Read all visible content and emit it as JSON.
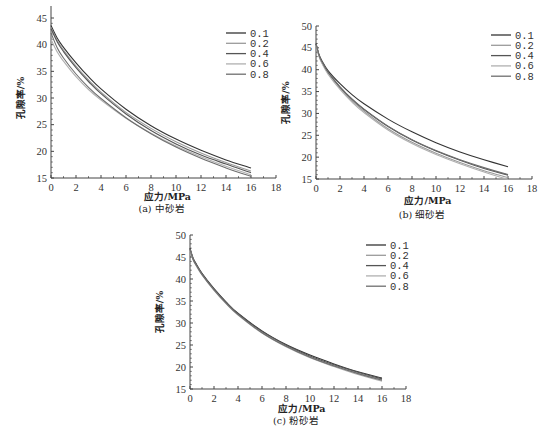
{
  "chart_data": [
    {
      "id": "a",
      "type": "line",
      "title": "(a) 中砂岩",
      "xlabel": "应力/MPa",
      "ylabel": "孔隙率/%",
      "xlim": [
        0,
        18
      ],
      "ylim": [
        15,
        47
      ],
      "xticks": [
        0,
        2,
        4,
        6,
        8,
        10,
        12,
        14,
        16,
        18
      ],
      "yticks": [
        15,
        20,
        25,
        30,
        35,
        40,
        45
      ],
      "grid": false,
      "legend_position": "upper right",
      "x": [
        0,
        0.5,
        1,
        2,
        3,
        4,
        6,
        8,
        10,
        12,
        14,
        16
      ],
      "series": [
        {
          "name": "0.1",
          "color": "#333333",
          "values": [
            43.6,
            41.2,
            39.5,
            36.6,
            34.0,
            31.7,
            27.9,
            24.8,
            22.3,
            20.2,
            18.4,
            16.9
          ]
        },
        {
          "name": "0.2",
          "color": "#9a9a9a",
          "values": [
            43.2,
            40.8,
            39.0,
            36.0,
            33.4,
            31.1,
            27.3,
            24.3,
            21.8,
            19.7,
            17.9,
            16.3
          ]
        },
        {
          "name": "0.4",
          "color": "#555555",
          "values": [
            43.0,
            40.5,
            38.7,
            35.7,
            33.1,
            30.8,
            27.0,
            23.9,
            21.4,
            19.3,
            17.6,
            16.0
          ]
        },
        {
          "name": "0.6",
          "color": "#b0b0b0",
          "values": [
            41.0,
            38.6,
            36.9,
            34.0,
            31.6,
            29.6,
            26.2,
            23.4,
            21.0,
            19.0,
            17.2,
            15.6
          ]
        },
        {
          "name": "0.8",
          "color": "#6e6e6e",
          "values": [
            42.2,
            39.4,
            37.5,
            34.5,
            32.0,
            29.9,
            26.3,
            23.3,
            20.8,
            18.7,
            16.9,
            15.3
          ]
        }
      ]
    },
    {
      "id": "b",
      "type": "line",
      "title": "(b) 细砂岩",
      "xlabel": "应力/MPa",
      "ylabel": "孔隙率/%",
      "xlim": [
        0,
        18
      ],
      "ylim": [
        15,
        50
      ],
      "xticks": [
        0,
        2,
        4,
        6,
        8,
        10,
        12,
        14,
        16,
        18
      ],
      "yticks": [
        15,
        20,
        25,
        30,
        35,
        40,
        45,
        50
      ],
      "grid": false,
      "legend_position": "upper right",
      "x": [
        0,
        0.25,
        0.5,
        1,
        2,
        3,
        4,
        6,
        8,
        10,
        12,
        14,
        16
      ],
      "series": [
        {
          "name": "0.1",
          "color": "#333333",
          "values": [
            46.0,
            43.5,
            42.0,
            39.8,
            36.8,
            34.3,
            32.2,
            28.7,
            25.8,
            23.3,
            21.2,
            19.4,
            17.8
          ]
        },
        {
          "name": "0.2",
          "color": "#9a9a9a",
          "values": [
            45.8,
            43.2,
            41.6,
            39.3,
            35.8,
            32.9,
            30.5,
            26.5,
            23.4,
            20.9,
            18.8,
            16.9,
            15.3
          ]
        },
        {
          "name": "0.4",
          "color": "#555555",
          "values": [
            45.9,
            43.3,
            41.7,
            39.4,
            36.0,
            33.2,
            30.9,
            27.0,
            23.9,
            21.4,
            19.3,
            17.4,
            15.9
          ]
        },
        {
          "name": "0.6",
          "color": "#b0b0b0",
          "values": [
            45.7,
            43.0,
            41.4,
            39.0,
            35.5,
            32.6,
            30.2,
            26.2,
            23.1,
            20.6,
            18.5,
            16.6,
            14.9
          ]
        },
        {
          "name": "0.8",
          "color": "#6e6e6e",
          "values": [
            45.9,
            43.3,
            41.8,
            39.5,
            36.1,
            33.3,
            31.0,
            27.1,
            24.0,
            21.5,
            19.4,
            17.6,
            16.0
          ]
        }
      ]
    },
    {
      "id": "c",
      "type": "line",
      "title": "(c) 粉砂岩",
      "xlabel": "应力/MPa",
      "ylabel": "孔隙率/%",
      "xlim": [
        0,
        18
      ],
      "ylim": [
        15,
        50
      ],
      "xticks": [
        0,
        2,
        4,
        6,
        8,
        10,
        12,
        14,
        16,
        18
      ],
      "yticks": [
        15,
        20,
        25,
        30,
        35,
        40,
        45,
        50
      ],
      "grid": false,
      "legend_position": "upper right",
      "x": [
        0,
        0.25,
        0.5,
        1,
        2,
        3,
        4,
        6,
        8,
        10,
        12,
        14,
        16
      ],
      "series": [
        {
          "name": "0.1",
          "color": "#333333",
          "values": [
            47.0,
            44.8,
            43.5,
            41.3,
            37.8,
            34.8,
            32.2,
            28.2,
            25.1,
            22.7,
            20.7,
            18.9,
            17.5
          ]
        },
        {
          "name": "0.2",
          "color": "#9a9a9a",
          "values": [
            46.8,
            44.6,
            43.3,
            41.1,
            37.6,
            34.6,
            32.0,
            27.9,
            24.8,
            22.3,
            20.3,
            18.6,
            17.1
          ]
        },
        {
          "name": "0.4",
          "color": "#555555",
          "values": [
            46.9,
            44.7,
            43.4,
            41.2,
            37.7,
            34.7,
            32.1,
            28.1,
            25.0,
            22.5,
            20.5,
            18.8,
            17.3
          ]
        },
        {
          "name": "0.6",
          "color": "#b0b0b0",
          "values": [
            46.6,
            44.4,
            43.1,
            40.9,
            37.4,
            34.4,
            31.8,
            27.7,
            24.6,
            22.1,
            20.1,
            18.3,
            16.8
          ]
        },
        {
          "name": "0.8",
          "color": "#6e6e6e",
          "values": [
            46.7,
            44.5,
            43.2,
            41.0,
            37.5,
            34.5,
            31.9,
            27.8,
            24.7,
            22.2,
            20.2,
            18.5,
            17.0
          ]
        }
      ]
    }
  ],
  "layout": [
    {
      "left": 51,
      "right": 276,
      "top": 18,
      "bottom": 178,
      "legendX": 226,
      "legendY": 33,
      "captionY": 212,
      "xlabelY": 200
    },
    {
      "left": 316,
      "right": 532,
      "top": 26,
      "bottom": 179,
      "legendX": 491,
      "legendY": 35,
      "captionY": 218,
      "xlabelY": 204
    },
    {
      "left": 190,
      "right": 406,
      "top": 235,
      "bottom": 389,
      "legendX": 366,
      "legendY": 245,
      "captionY": 424,
      "xlabelY": 412
    }
  ]
}
